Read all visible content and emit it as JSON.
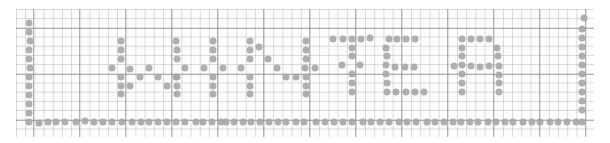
{
  "image": {
    "description": "Graph paper with the word spelled in gray dots, framed by dotted border on left, bottom and right",
    "word": "WHWTER",
    "dot_color": "#a6a6a6",
    "grid_color": "#aaaaaa"
  },
  "dots": [
    [
      29,
      23
    ],
    [
      29,
      32
    ],
    [
      30,
      41
    ],
    [
      29,
      50
    ],
    [
      29,
      59
    ],
    [
      30,
      68
    ],
    [
      29,
      77
    ],
    [
      29,
      86
    ],
    [
      29,
      95
    ],
    [
      29,
      104
    ],
    [
      29,
      113
    ],
    [
      29,
      122
    ],
    [
      39,
      123
    ],
    [
      48,
      122
    ],
    [
      56,
      122
    ],
    [
      65,
      122
    ],
    [
      76,
      122
    ],
    [
      85,
      121
    ],
    [
      94,
      122
    ],
    [
      103,
      122
    ],
    [
      112,
      122
    ],
    [
      122,
      122
    ],
    [
      132,
      122
    ],
    [
      141,
      122
    ],
    [
      149,
      122
    ],
    [
      158,
      122
    ],
    [
      167,
      122
    ],
    [
      176,
      122
    ],
    [
      185,
      122
    ],
    [
      196,
      122
    ],
    [
      203,
      122
    ],
    [
      212,
      122
    ],
    [
      221,
      122
    ],
    [
      226,
      122
    ],
    [
      234,
      122
    ],
    [
      243,
      122
    ],
    [
      251,
      122
    ],
    [
      260,
      122
    ],
    [
      269,
      122
    ],
    [
      278,
      122
    ],
    [
      286,
      122
    ],
    [
      296,
      122
    ],
    [
      304,
      122
    ],
    [
      316,
      122
    ],
    [
      325,
      122
    ],
    [
      334,
      122
    ],
    [
      343,
      122
    ],
    [
      352,
      122
    ],
    [
      363,
      122
    ],
    [
      371,
      122
    ],
    [
      380,
      122
    ],
    [
      389,
      122
    ],
    [
      399,
      122
    ],
    [
      407,
      122
    ],
    [
      416,
      122
    ],
    [
      427,
      122
    ],
    [
      435,
      122
    ],
    [
      444,
      122
    ],
    [
      453,
      122
    ],
    [
      461,
      122
    ],
    [
      470,
      122
    ],
    [
      478,
      122
    ],
    [
      488,
      122
    ],
    [
      496,
      122
    ],
    [
      505,
      122
    ],
    [
      513,
      122
    ],
    [
      523,
      122
    ],
    [
      532,
      122
    ],
    [
      540,
      122
    ],
    [
      550,
      122
    ],
    [
      558,
      122
    ],
    [
      567,
      122
    ],
    [
      576,
      122
    ],
    [
      582,
      122
    ],
    [
      584,
      18
    ],
    [
      582,
      29
    ],
    [
      582,
      38
    ],
    [
      582,
      47
    ],
    [
      582,
      56
    ],
    [
      582,
      65
    ],
    [
      582,
      74
    ],
    [
      582,
      83
    ],
    [
      582,
      92
    ],
    [
      582,
      101
    ],
    [
      582,
      110
    ],
    [
      121,
      41
    ],
    [
      121,
      50
    ],
    [
      121,
      59
    ],
    [
      112,
      68
    ],
    [
      130,
      69
    ],
    [
      121,
      77
    ],
    [
      121,
      86
    ],
    [
      130,
      86
    ],
    [
      121,
      94
    ],
    [
      140,
      77
    ],
    [
      149,
      68
    ],
    [
      158,
      77
    ],
    [
      167,
      86
    ],
    [
      176,
      77
    ],
    [
      176,
      41
    ],
    [
      177,
      50
    ],
    [
      177,
      59
    ],
    [
      185,
      68
    ],
    [
      177,
      77
    ],
    [
      177,
      86
    ],
    [
      177,
      94
    ],
    [
      204,
      68
    ],
    [
      213,
      41
    ],
    [
      213,
      50
    ],
    [
      213,
      59
    ],
    [
      213,
      77
    ],
    [
      213,
      86
    ],
    [
      213,
      94
    ],
    [
      223,
      68
    ],
    [
      241,
      68
    ],
    [
      250,
      41
    ],
    [
      250,
      50
    ],
    [
      250,
      59
    ],
    [
      250,
      77
    ],
    [
      250,
      86
    ],
    [
      250,
      94
    ],
    [
      259,
      47
    ],
    [
      268,
      59
    ],
    [
      277,
      68
    ],
    [
      286,
      77
    ],
    [
      296,
      77
    ],
    [
      305,
      68
    ],
    [
      306,
      41
    ],
    [
      306,
      50
    ],
    [
      306,
      59
    ],
    [
      306,
      77
    ],
    [
      306,
      86
    ],
    [
      306,
      94
    ],
    [
      315,
      68
    ],
    [
      333,
      39
    ],
    [
      343,
      39
    ],
    [
      352,
      39
    ],
    [
      361,
      39
    ],
    [
      370,
      38
    ],
    [
      352,
      48
    ],
    [
      352,
      56
    ],
    [
      342,
      65
    ],
    [
      352,
      74
    ],
    [
      352,
      83
    ],
    [
      352,
      92
    ],
    [
      360,
      65
    ],
    [
      389,
      39
    ],
    [
      397,
      39
    ],
    [
      406,
      39
    ],
    [
      415,
      39
    ],
    [
      386,
      48
    ],
    [
      387,
      56
    ],
    [
      386,
      65
    ],
    [
      395,
      67
    ],
    [
      405,
      67
    ],
    [
      414,
      67
    ],
    [
      386,
      74
    ],
    [
      387,
      83
    ],
    [
      387,
      92
    ],
    [
      396,
      92
    ],
    [
      406,
      92
    ],
    [
      415,
      92
    ],
    [
      424,
      92
    ],
    [
      454,
      66
    ],
    [
      462,
      39
    ],
    [
      471,
      39
    ],
    [
      480,
      39
    ],
    [
      489,
      39
    ],
    [
      462,
      48
    ],
    [
      462,
      56
    ],
    [
      462,
      65
    ],
    [
      462,
      74
    ],
    [
      462,
      83
    ],
    [
      462,
      92
    ],
    [
      471,
      66
    ],
    [
      480,
      67
    ],
    [
      489,
      66
    ],
    [
      497,
      48
    ],
    [
      498,
      56
    ],
    [
      499,
      66
    ],
    [
      499,
      75
    ],
    [
      499,
      83
    ],
    [
      499,
      92
    ]
  ]
}
